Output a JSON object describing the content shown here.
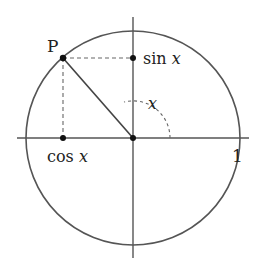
{
  "diagram": {
    "colors": {
      "stroke": "#555555",
      "point": "#111111",
      "text": "#222222",
      "background": "#ffffff"
    },
    "geometry": {
      "center": [
        133,
        138
      ],
      "radius": 107,
      "point_P": [
        63,
        58
      ],
      "angle_arc_radius": 37
    },
    "labels": {
      "point": "P",
      "sin_fn": "sin",
      "sin_var": "x",
      "cos_fn": "cos",
      "cos_var": "x",
      "angle": "x",
      "one": "1"
    }
  }
}
